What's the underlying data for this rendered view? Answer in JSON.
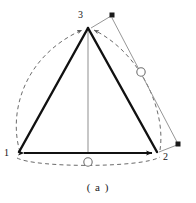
{
  "figure": {
    "caption": "( a )",
    "vertex_labels": {
      "v1": "1",
      "v2": "2",
      "v3": "3"
    },
    "colors": {
      "edge": "#111111",
      "dashed_arc": "#6b6b6b",
      "leader_line": "#8a8a8a",
      "median_line": "#8f8f8f",
      "marker_square": "#1a1a1a",
      "marker_circle_stroke": "#6f6f6f",
      "background": "#ffffff",
      "text": "#141414"
    },
    "geometry": {
      "v1": [
        18,
        153
      ],
      "v2": [
        158,
        153
      ],
      "v3": [
        88,
        27
      ],
      "median_base_point": [
        88,
        153
      ],
      "circle_marker_right": [
        141,
        72
      ],
      "circle_marker_bottom": [
        88,
        162
      ],
      "square_marker_top_right": [
        112,
        15
      ],
      "square_marker_bottom_right": [
        178,
        144
      ]
    },
    "elements": [
      {
        "name": "triangle-edge-1-3",
        "type": "solid-thick"
      },
      {
        "name": "triangle-edge-3-2",
        "type": "solid-thick"
      },
      {
        "name": "triangle-edge-1-2",
        "type": "solid-thick-arrow-both"
      },
      {
        "name": "dashed-arc-left",
        "type": "dashed"
      },
      {
        "name": "dashed-arc-right",
        "type": "dashed"
      },
      {
        "name": "dashed-arc-bottom",
        "type": "dashed"
      },
      {
        "name": "median-line",
        "type": "thin-gray"
      },
      {
        "name": "leader-line-upper-right",
        "type": "thin-gray"
      },
      {
        "name": "leader-line-lower-right",
        "type": "thin-gray"
      }
    ]
  }
}
